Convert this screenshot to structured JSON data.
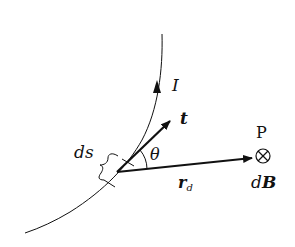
{
  "diagram": {
    "labels": {
      "current": "I",
      "tangent": "t",
      "angle": "θ",
      "element": "ds",
      "point": "P",
      "field_d": "d",
      "field_B": "B",
      "radius_r": "r",
      "radius_sub": "d"
    },
    "symbols": {
      "field_direction": "into-page (⊗)"
    },
    "colors": {
      "stroke": "#111111",
      "background": "#ffffff"
    }
  }
}
